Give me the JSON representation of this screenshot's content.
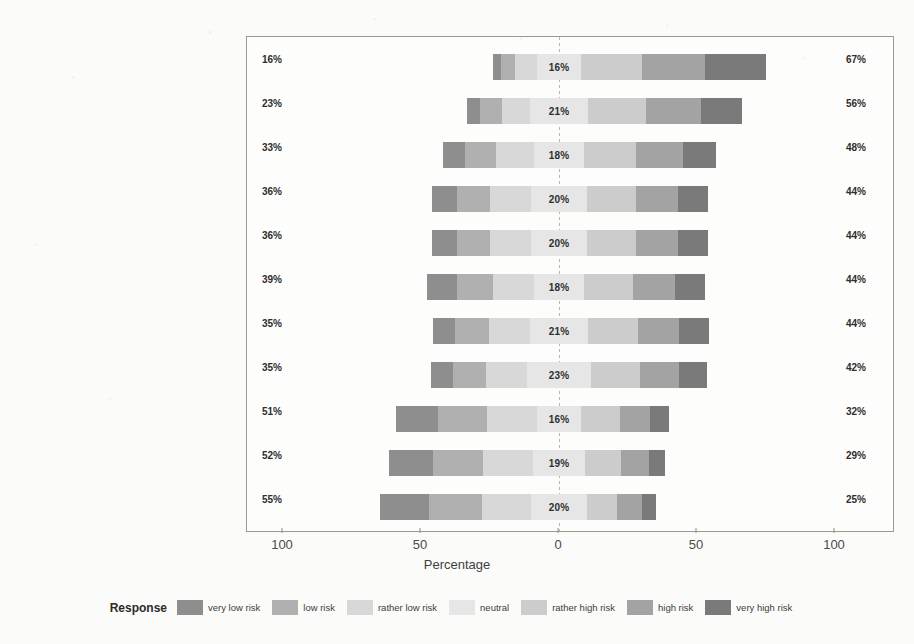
{
  "chart_data": {
    "type": "bar",
    "subtype": "diverging-stacked-likert",
    "title": "",
    "xlabel": "Percentage",
    "ylabel": "",
    "xlim": [
      -100,
      100
    ],
    "xticks": [
      {
        "label": "100",
        "value": -100
      },
      {
        "label": "50",
        "value": -50
      },
      {
        "label": "0",
        "value": 0
      },
      {
        "label": "50",
        "value": 50
      },
      {
        "label": "100",
        "value": 100
      }
    ],
    "grid": false,
    "legend_title": "Response",
    "legend_position": "bottom",
    "legend_entries": [
      {
        "name": "very low risk",
        "color": "#8e8e8e"
      },
      {
        "name": "low risk",
        "color": "#b0b0b0"
      },
      {
        "name": "rather low risk",
        "color": "#d8d8d8"
      },
      {
        "name": "neutral",
        "color": "#e6e6e6"
      },
      {
        "name": "rather high risk",
        "color": "#cccccc"
      },
      {
        "name": "high risk",
        "color": "#a3a3a3"
      },
      {
        "name": "very high risk",
        "color": "#7a7a7a"
      }
    ],
    "categories": [
      "Value Fluctuation",
      "Hosted Wallet Vulnerabilities",
      "Theft (Malware)",
      "Mining Centralization",
      "Key Loss (Device Failure)",
      "Theft (Unencrypted Wallets)",
      "Monetary Loss",
      "De-anonymization",
      "DoS Attack",
      "Double Spending",
      "Cryptographic Flaws"
    ],
    "series": [
      {
        "name": "very low risk",
        "values": [
          3,
          5,
          8,
          9,
          9,
          11,
          8,
          8,
          15,
          16,
          18
        ]
      },
      {
        "name": "low risk",
        "values": [
          5,
          8,
          11,
          12,
          12,
          13,
          12,
          12,
          18,
          18,
          19
        ]
      },
      {
        "name": "rather low risk",
        "values": [
          8,
          10,
          14,
          15,
          15,
          15,
          15,
          15,
          18,
          18,
          18
        ]
      },
      {
        "name": "neutral",
        "values": [
          16,
          21,
          18,
          20,
          20,
          18,
          21,
          23,
          16,
          19,
          20
        ]
      },
      {
        "name": "rather high risk",
        "values": [
          22,
          21,
          19,
          18,
          18,
          18,
          18,
          18,
          14,
          13,
          11
        ]
      },
      {
        "name": "high risk",
        "values": [
          23,
          20,
          17,
          15,
          15,
          15,
          15,
          14,
          11,
          10,
          9
        ]
      },
      {
        "name": "very high risk",
        "values": [
          22,
          15,
          12,
          11,
          11,
          11,
          11,
          10,
          7,
          6,
          5
        ]
      }
    ],
    "rows": [
      {
        "category": "Value Fluctuation",
        "left_pct": "16%",
        "neutral_pct": "16%",
        "right_pct": "67%",
        "low": [
          3,
          5,
          8
        ],
        "neutral": 16,
        "high": [
          22,
          23,
          22
        ]
      },
      {
        "category": "Hosted Wallet Vulnerabilities",
        "left_pct": "23%",
        "neutral_pct": "21%",
        "right_pct": "56%",
        "low": [
          5,
          8,
          10
        ],
        "neutral": 21,
        "high": [
          21,
          20,
          15
        ]
      },
      {
        "category": "Theft (Malware)",
        "left_pct": "33%",
        "neutral_pct": "18%",
        "right_pct": "48%",
        "low": [
          8,
          11,
          14
        ],
        "neutral": 18,
        "high": [
          19,
          17,
          12
        ]
      },
      {
        "category": "Mining Centralization",
        "left_pct": "36%",
        "neutral_pct": "20%",
        "right_pct": "44%",
        "low": [
          9,
          12,
          15
        ],
        "neutral": 20,
        "high": [
          18,
          15,
          11
        ]
      },
      {
        "category": "Key Loss (Device Failure)",
        "left_pct": "36%",
        "neutral_pct": "20%",
        "right_pct": "44%",
        "low": [
          9,
          12,
          15
        ],
        "neutral": 20,
        "high": [
          18,
          15,
          11
        ]
      },
      {
        "category": "Theft (Unencrypted Wallets)",
        "left_pct": "39%",
        "neutral_pct": "18%",
        "right_pct": "44%",
        "low": [
          11,
          13,
          15
        ],
        "neutral": 18,
        "high": [
          18,
          15,
          11
        ]
      },
      {
        "category": "Monetary Loss",
        "left_pct": "35%",
        "neutral_pct": "21%",
        "right_pct": "44%",
        "low": [
          8,
          12,
          15
        ],
        "neutral": 21,
        "high": [
          18,
          15,
          11
        ]
      },
      {
        "category": "De-anonymization",
        "left_pct": "35%",
        "neutral_pct": "23%",
        "right_pct": "42%",
        "low": [
          8,
          12,
          15
        ],
        "neutral": 23,
        "high": [
          18,
          14,
          10
        ]
      },
      {
        "category": "DoS Attack",
        "left_pct": "51%",
        "neutral_pct": "16%",
        "right_pct": "32%",
        "low": [
          15,
          18,
          18
        ],
        "neutral": 16,
        "high": [
          14,
          11,
          7
        ]
      },
      {
        "category": "Double Spending",
        "left_pct": "52%",
        "neutral_pct": "19%",
        "right_pct": "29%",
        "low": [
          16,
          18,
          18
        ],
        "neutral": 19,
        "high": [
          13,
          10,
          6
        ]
      },
      {
        "category": "Cryptographic Flaws",
        "left_pct": "55%",
        "neutral_pct": "20%",
        "right_pct": "25%",
        "low": [
          18,
          19,
          18
        ],
        "neutral": 20,
        "high": [
          11,
          9,
          5
        ]
      }
    ]
  }
}
